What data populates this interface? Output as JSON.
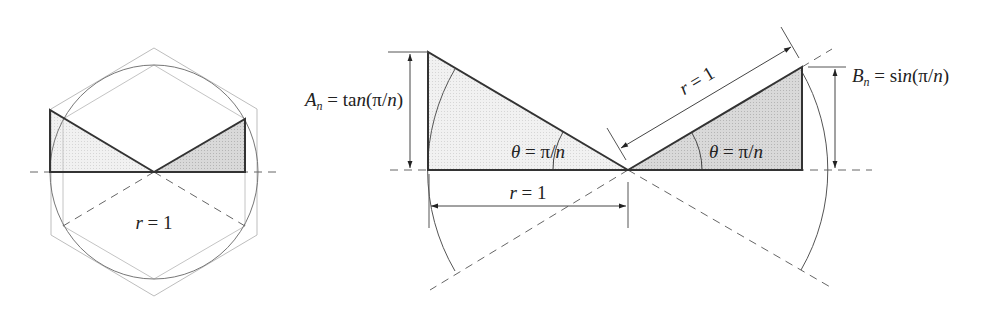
{
  "figure": {
    "colors": {
      "stroke_dark": "#333333",
      "stroke_thin": "#555555",
      "stroke_light": "#b0b0b0",
      "fill_light_triangle": "#ececec",
      "fill_dark_triangle": "#d2d2d2",
      "dash": "#666666"
    },
    "left_panel": {
      "description": "Circle of radius r = 1 with inscribed and circumscribed hexagons; shaded triangles show tangent and sine segments",
      "radius_label": "r = 1",
      "polygon_sides": 6
    },
    "right_panel": {
      "tangent_label": {
        "symbol": "A",
        "subscript": "n",
        "expression": " = tan(π/n)"
      },
      "sine_label": {
        "symbol": "B",
        "subscript": "n",
        "expression": " = sin(π/n)"
      },
      "angle_label_left": "θ = π/n",
      "angle_label_right": "θ = π/n",
      "radius_label_horizontal": "r = 1",
      "radius_label_diagonal": "r = 1"
    }
  }
}
